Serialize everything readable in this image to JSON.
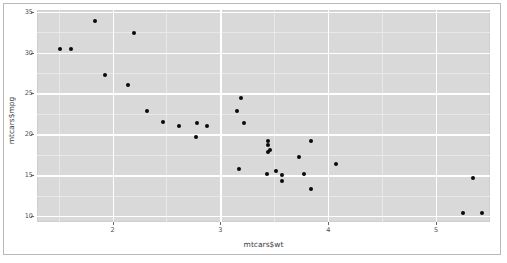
{
  "chart_data": {
    "type": "scatter",
    "title": "",
    "xlabel": "mtcars$wt",
    "ylabel": "mtcars$mpg",
    "xlim": [
      1.3,
      5.5
    ],
    "ylim": [
      9.3,
      35.2
    ],
    "xticks": [
      2,
      3,
      4,
      5
    ],
    "yticks": [
      10,
      15,
      20,
      25,
      30,
      35
    ],
    "xtick_labels": [
      "2",
      "3",
      "4",
      "5"
    ],
    "ytick_labels": [
      "10",
      "15",
      "20",
      "25",
      "30",
      "35"
    ],
    "grid": true,
    "legend": "none",
    "point_color": "#0a0a0a",
    "panel_color": "#d9d9d9",
    "gridline_color": "#ffffff",
    "n_points": 32,
    "x": [
      2.62,
      2.875,
      2.32,
      3.215,
      3.44,
      3.46,
      3.57,
      3.19,
      3.15,
      3.44,
      3.44,
      4.07,
      3.73,
      3.78,
      5.25,
      5.424,
      5.345,
      2.2,
      1.615,
      1.835,
      2.465,
      3.52,
      3.435,
      3.84,
      3.845,
      1.935,
      2.14,
      1.513,
      3.17,
      2.77,
      3.57,
      2.78
    ],
    "y": [
      21.0,
      21.0,
      22.8,
      21.4,
      18.7,
      18.1,
      14.3,
      24.4,
      22.8,
      19.2,
      17.8,
      16.4,
      17.3,
      15.2,
      10.4,
      10.4,
      14.7,
      32.4,
      30.4,
      33.9,
      21.5,
      15.5,
      15.2,
      13.3,
      19.2,
      27.3,
      26.0,
      30.4,
      15.8,
      19.7,
      15.0,
      21.4
    ]
  },
  "axes": {
    "x_title": "mtcars$wt",
    "y_title": "mtcars$mpg"
  }
}
